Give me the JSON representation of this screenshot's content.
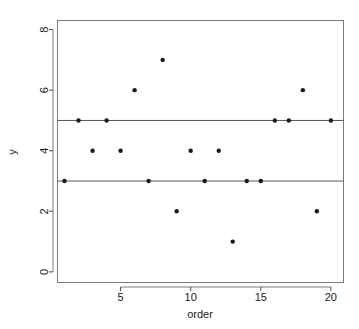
{
  "chart_data": {
    "type": "scatter",
    "title": "",
    "xlabel": "order",
    "ylabel": "y",
    "xlim": [
      0.5,
      20.9
    ],
    "ylim": [
      -0.35,
      8.3
    ],
    "grid": false,
    "legend": null,
    "x": [
      1,
      2,
      3,
      4,
      5,
      6,
      7,
      8,
      9,
      10,
      11,
      12,
      13,
      14,
      15,
      16,
      17,
      18,
      19,
      20
    ],
    "y": [
      3,
      5,
      4,
      5,
      4,
      6,
      3,
      7,
      2,
      4,
      3,
      4,
      1,
      3,
      3,
      5,
      5,
      6,
      2,
      5
    ],
    "points": [
      {
        "x": 1,
        "y": 3
      },
      {
        "x": 2,
        "y": 5
      },
      {
        "x": 3,
        "y": 4
      },
      {
        "x": 4,
        "y": 5
      },
      {
        "x": 5,
        "y": 4
      },
      {
        "x": 6,
        "y": 6
      },
      {
        "x": 7,
        "y": 3
      },
      {
        "x": 8,
        "y": 7
      },
      {
        "x": 9,
        "y": 2
      },
      {
        "x": 10,
        "y": 4
      },
      {
        "x": 11,
        "y": 3
      },
      {
        "x": 12,
        "y": 4
      },
      {
        "x": 13,
        "y": 1
      },
      {
        "x": 14,
        "y": 3
      },
      {
        "x": 15,
        "y": 3
      },
      {
        "x": 16,
        "y": 5
      },
      {
        "x": 17,
        "y": 5
      },
      {
        "x": 18,
        "y": 6
      },
      {
        "x": 19,
        "y": 2
      },
      {
        "x": 20,
        "y": 5
      }
    ],
    "reference_lines": [
      {
        "orientation": "horizontal",
        "value": 5,
        "label": "upper"
      },
      {
        "orientation": "horizontal",
        "value": 3,
        "label": "lower"
      }
    ],
    "xticks": [
      5,
      10,
      15,
      20
    ],
    "xtick_labels": [
      "5",
      "10",
      "15",
      "20"
    ],
    "yticks": [
      0,
      2,
      4,
      6,
      8
    ],
    "ytick_labels": [
      "0",
      "2",
      "4",
      "6",
      "8"
    ],
    "colors": {
      "point": "#1a1a1a",
      "reference_line": "#555555",
      "axis": "#7a7a7a",
      "background": "#ffffff"
    },
    "point_radius": 2.2
  }
}
